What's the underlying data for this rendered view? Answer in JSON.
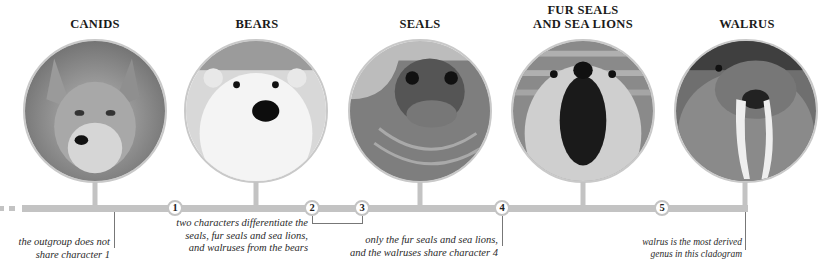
{
  "diagram": {
    "type": "cladogram",
    "taxa": [
      {
        "id": "canids",
        "title_lines": [
          "CANIDS"
        ],
        "photo": "fox-photo",
        "x": 95
      },
      {
        "id": "bears",
        "title_lines": [
          "BEARS"
        ],
        "photo": "polar-bear-photo",
        "x": 255
      },
      {
        "id": "seals",
        "title_lines": [
          "SEALS"
        ],
        "photo": "seal-photo",
        "x": 420
      },
      {
        "id": "fur-seals",
        "title_lines": [
          "FUR SEALS",
          "AND SEA LIONS"
        ],
        "photo": "fur-seal-photo",
        "x": 583
      },
      {
        "id": "walrus",
        "title_lines": [
          "WALRUS"
        ],
        "photo": "walrus-photo",
        "x": 746
      }
    ],
    "characters": [
      {
        "label": "1",
        "x": 175
      },
      {
        "label": "2",
        "x": 312
      },
      {
        "label": "3",
        "x": 362
      },
      {
        "label": "4",
        "x": 502
      },
      {
        "label": "5",
        "x": 662
      }
    ],
    "notes": [
      {
        "id": "outgroup",
        "lines": [
          "the outgroup does not",
          "share character 1"
        ]
      },
      {
        "id": "chars-2-3",
        "lines": [
          "two characters differentiate the",
          "seals, fur seals and sea lions,",
          "and walruses from the bears"
        ]
      },
      {
        "id": "char-4",
        "lines": [
          "only the fur seals and sea lions,",
          "and the walruses share character 4"
        ]
      },
      {
        "id": "walrus-derived",
        "lines": [
          "walrus is the most derived",
          "genus in this cladogram"
        ]
      }
    ],
    "colors": {
      "line": "#c3c3c3",
      "node_fill": "#ffffff",
      "leader": "#777777",
      "text": "#222222"
    }
  }
}
